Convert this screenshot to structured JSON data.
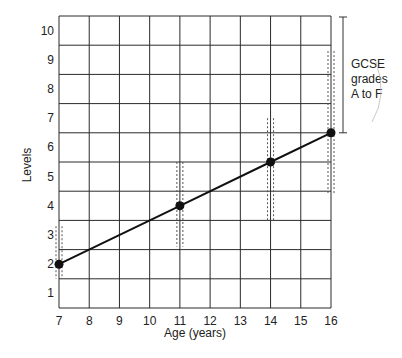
{
  "chart_data": {
    "type": "line",
    "title": "",
    "xlabel": "Age (years)",
    "ylabel": "Levels",
    "x_ticks": [
      7,
      8,
      9,
      10,
      11,
      12,
      13,
      14,
      15,
      16
    ],
    "y_ticks": [
      1,
      2,
      3,
      4,
      5,
      6,
      7,
      8,
      9,
      10
    ],
    "xlim": [
      7,
      16
    ],
    "ylim": [
      0.5,
      10.5
    ],
    "grid": true,
    "series": [
      {
        "name": "Expected level",
        "x": [
          7,
          11,
          14,
          16
        ],
        "y": [
          2,
          4,
          5.5,
          6.5
        ]
      }
    ],
    "ranges": [
      {
        "x": 7,
        "low": 1.5,
        "high": 3.3
      },
      {
        "x": 11,
        "low": 2.6,
        "high": 5.5
      },
      {
        "x": 14,
        "low": 3.5,
        "high": 7
      },
      {
        "x": 16,
        "low": 4.4,
        "high": 9.3
      }
    ],
    "annotation": {
      "lines": [
        "GCSE",
        "grades",
        "A to F"
      ],
      "bracket_y_range": [
        6.5,
        10.5
      ]
    }
  },
  "labels": {
    "xlabel": "Age (years)",
    "ylabel": "Levels",
    "annotation_line1": "GCSE",
    "annotation_line2": "grades",
    "annotation_line3": "A to F"
  },
  "colors": {
    "line": "#111111",
    "grid": "#2a2a2a",
    "dashed": "#555555"
  }
}
